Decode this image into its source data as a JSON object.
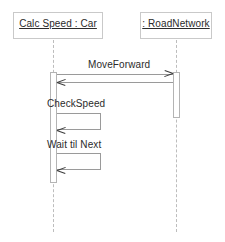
{
  "diagram": {
    "type": "uml-sequence-diagram",
    "background_color": "#ffffff",
    "line_color": "#9a9a9a",
    "text_color": "#2b2b2b",
    "width": 225,
    "height": 242
  },
  "participants": [
    {
      "id": "car",
      "label": "Calc Speed : Car",
      "box": {
        "x": 13,
        "y": 12,
        "width": 90,
        "height": 27
      },
      "lifeline_x": 53,
      "activation": {
        "x": 50,
        "y": 72,
        "width": 7,
        "height": 111
      }
    },
    {
      "id": "roadnetwork",
      "label": ": RoadNetwork",
      "box": {
        "x": 140,
        "y": 12,
        "width": 72,
        "height": 27
      },
      "lifeline_x": 176,
      "activation": {
        "x": 173,
        "y": 72,
        "width": 7,
        "height": 46
      }
    }
  ],
  "messages": [
    {
      "id": "m1",
      "label": "MoveForward",
      "kind": "call",
      "direction": "right",
      "from": "car",
      "to": "roadnetwork",
      "y": 74,
      "label_x": 88,
      "label_y": 59
    },
    {
      "id": "m2",
      "label": "",
      "kind": "return",
      "direction": "left",
      "from": "roadnetwork",
      "to": "car",
      "y": 82
    },
    {
      "id": "m3",
      "label": "CheckSpeed",
      "kind": "self",
      "from": "car",
      "to": "car",
      "label_x": 47,
      "label_y": 98,
      "loop": {
        "x": 57,
        "y": 113,
        "width": 44,
        "height": 17
      },
      "arrow_y": 130
    },
    {
      "id": "m4",
      "label": "Wait til Next",
      "kind": "self",
      "from": "car",
      "to": "car",
      "label_x": 47,
      "label_y": 139,
      "loop": {
        "x": 57,
        "y": 153,
        "width": 44,
        "height": 17
      },
      "arrow_y": 170
    }
  ],
  "lifelines": {
    "top": 40,
    "bottom": 232
  }
}
